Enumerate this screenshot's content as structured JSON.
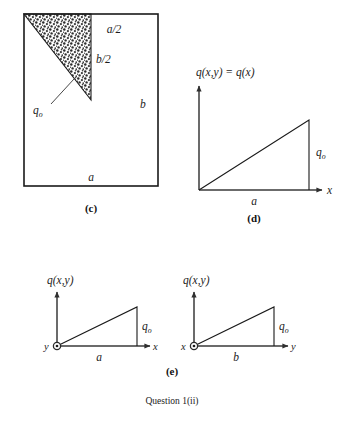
{
  "figure": {
    "caption": "Question 1(ii)",
    "panels": [
      {
        "id": "c",
        "caption": "(c)",
        "type": "plan-view-plate",
        "description": "Rectangular plate of dimensions a by b with a stippled triangular loaded region in the upper-left corner",
        "labels": {
          "width": "a",
          "height": "b",
          "half_width": "a/2",
          "half_height": "b/2",
          "load": "q",
          "load_sub": "o"
        }
      },
      {
        "id": "d",
        "caption": "(d)",
        "type": "load-distribution-plot",
        "description": "Linearly varying load q(x,y) = q(x) increasing along x from 0 to q-sub-o over span a",
        "labels": {
          "ordinate": "q(x,y) = q(x)",
          "x_axis": "x",
          "span": "a",
          "peak": "q",
          "peak_sub": "o"
        }
      },
      {
        "id": "e",
        "caption": "(e)",
        "type": "load-distribution-pair",
        "subplots": [
          {
            "id": "e-left",
            "description": "Load varying along x over span a viewed with y out of page",
            "labels": {
              "ordinate": "q(x,y)",
              "origin_axis": "y",
              "horizontal_axis": "x",
              "span": "a",
              "peak": "q",
              "peak_sub": "o"
            }
          },
          {
            "id": "e-right",
            "description": "Load varying along y over span b viewed with x out of page",
            "labels": {
              "ordinate": "q(x,y)",
              "origin_axis": "x",
              "horizontal_axis": "y",
              "span": "b",
              "peak": "q",
              "peak_sub": "o"
            }
          }
        ]
      }
    ]
  },
  "style": {
    "ink": "#1a1a1a",
    "axis": "#3a3a3a",
    "paper": "#ffffff"
  }
}
